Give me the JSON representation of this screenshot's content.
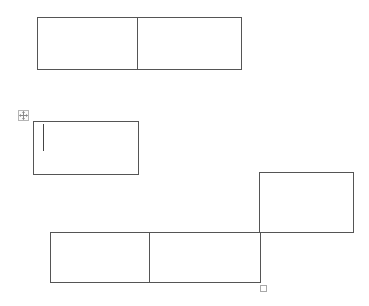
{
  "document": {
    "background": "#ffffff",
    "border_color": "#555555",
    "tables": [
      {
        "id": "table-1",
        "rows": 1,
        "cols": 2,
        "cells": [
          [
            "",
            ""
          ]
        ]
      },
      {
        "id": "table-2",
        "rows": 1,
        "cols": 1,
        "cells": [
          [
            ""
          ]
        ],
        "selected": true,
        "has_cursor": true
      },
      {
        "id": "table-3-floating-cell",
        "rows": 1,
        "cols": 1,
        "cells": [
          [
            ""
          ]
        ]
      },
      {
        "id": "table-4",
        "rows": 1,
        "cols": 2,
        "cells": [
          [
            "",
            ""
          ]
        ]
      }
    ],
    "handles": {
      "move_handle_icon": "move-arrows-icon",
      "resize_handle_icon": "resize-square-icon"
    }
  }
}
